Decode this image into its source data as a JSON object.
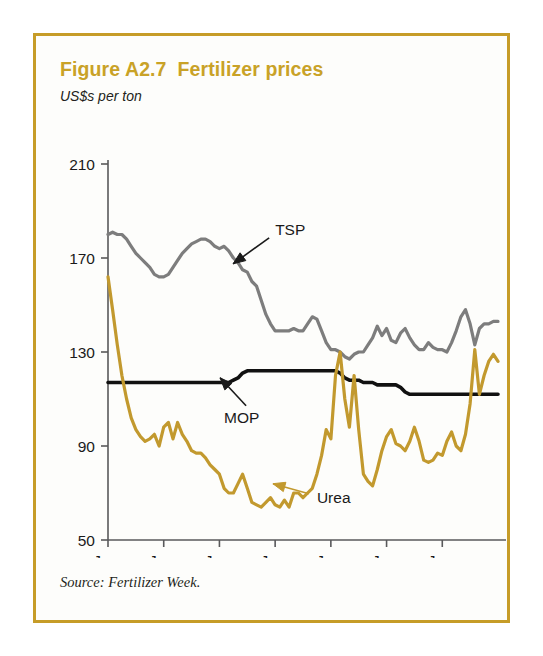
{
  "figure": {
    "title": "Figure A2.7  Fertilizer prices",
    "subtitle": "US$s per ton",
    "source": "Source: Fertilizer Week.",
    "border_color": "#c69c28",
    "title_color": "#c9a227"
  },
  "chart_data": {
    "type": "line",
    "title": "Figure A2.7  Fertilizer prices",
    "subtitle": "US$s per ton",
    "xlabel": "",
    "ylabel": "US$s per ton",
    "ylim": [
      50,
      210
    ],
    "yticks": [
      50,
      90,
      130,
      170,
      210
    ],
    "ytick_labels": [
      "50",
      "90",
      "130",
      "170",
      "210"
    ],
    "xlim": [
      0,
      84
    ],
    "xticks": [
      0,
      12,
      24,
      36,
      48,
      60,
      72
    ],
    "xtick_labels": [
      "Jan.\n1997",
      "Jan.\n1998",
      "Jan.\n1999",
      "Jan.\n2000",
      "Jan.\n2001",
      "Jan.\n2002",
      "Jan.\n2003"
    ],
    "xtick_months": [
      "Jan.",
      "Jan.",
      "Jan.",
      "Jan.",
      "Jan.",
      "Jan.",
      "Jan."
    ],
    "xtick_years": [
      "1997",
      "1998",
      "1999",
      "2000",
      "2001",
      "2002",
      "2003"
    ],
    "grid": false,
    "legend_position": "inline-annotations",
    "series": [
      {
        "name": "TSP",
        "color": "#7d7d7d",
        "label_x": 36,
        "label_y": 182,
        "values": [
          180,
          181,
          180,
          180,
          178,
          175,
          172,
          170,
          168,
          166,
          163,
          162,
          162,
          163,
          166,
          169,
          172,
          174,
          176,
          177,
          178,
          178,
          177,
          175,
          174,
          175,
          173,
          170,
          168,
          165,
          164,
          160,
          158,
          152,
          146,
          142,
          139,
          139,
          139,
          139,
          140,
          139,
          139,
          142,
          145,
          144,
          139,
          134,
          131,
          131,
          130,
          128,
          127,
          129,
          130,
          130,
          133,
          136,
          141,
          137,
          140,
          135,
          134,
          138,
          140,
          136,
          133,
          131,
          131,
          134,
          132,
          131,
          131,
          130,
          134,
          139,
          145,
          148,
          142,
          133,
          140,
          142,
          142,
          143,
          143
        ]
      },
      {
        "name": "MOP",
        "color": "#111111",
        "label_x": 25,
        "label_y": 102,
        "values": [
          117,
          117,
          117,
          117,
          117,
          117,
          117,
          117,
          117,
          117,
          117,
          117,
          117,
          117,
          117,
          117,
          117,
          117,
          117,
          117,
          117,
          117,
          117,
          117,
          117,
          117,
          117,
          118,
          119,
          121,
          122,
          122,
          122,
          122,
          122,
          122,
          122,
          122,
          122,
          122,
          122,
          122,
          122,
          122,
          122,
          122,
          122,
          122,
          122,
          122,
          121,
          119,
          118,
          118,
          118,
          117,
          117,
          117,
          116,
          116,
          116,
          116,
          116,
          115,
          113,
          112,
          112,
          112,
          112,
          112,
          112,
          112,
          112,
          112,
          112,
          112,
          112,
          112,
          112,
          112,
          112,
          112,
          112,
          112,
          112
        ]
      },
      {
        "name": "Urea",
        "color": "#c2992e",
        "label_x": 45,
        "label_y": 68,
        "values": [
          162,
          148,
          133,
          120,
          110,
          102,
          97,
          94,
          92,
          93,
          95,
          90,
          98,
          100,
          93,
          100,
          95,
          92,
          88,
          87,
          87,
          85,
          82,
          80,
          78,
          72,
          70,
          70,
          74,
          78,
          72,
          66,
          65,
          64,
          66,
          68,
          65,
          64,
          67,
          64,
          70,
          70,
          68,
          70,
          72,
          78,
          86,
          97,
          93,
          120,
          130,
          110,
          98,
          120,
          97,
          78,
          75,
          73,
          80,
          88,
          94,
          97,
          91,
          90,
          88,
          92,
          98,
          92,
          84,
          83,
          84,
          87,
          86,
          92,
          96,
          90,
          88,
          95,
          108,
          131,
          112,
          120,
          126,
          129,
          126
        ]
      }
    ],
    "annotations": [
      {
        "text": "TSP",
        "series": "TSP",
        "arrow": "down-left",
        "color": "#1a1a1a"
      },
      {
        "text": "MOP",
        "series": "MOP",
        "arrow": "up-left",
        "color": "#1a1a1a"
      },
      {
        "text": "Urea",
        "series": "Urea",
        "arrow": "left",
        "color": "#1a1a1a"
      }
    ]
  }
}
